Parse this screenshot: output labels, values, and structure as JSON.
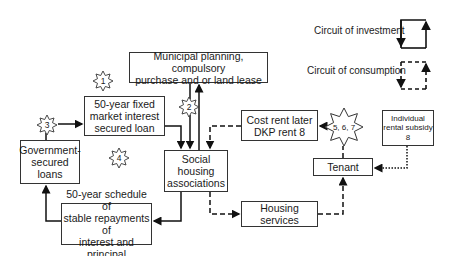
{
  "legend": {
    "investment_label": "Circuit of investment",
    "consumption_label": "Circuit of consumption"
  },
  "boxes": {
    "municipal": "Municipal planning, compulsory\npurchase and or land lease",
    "fixed_loan": "50-year fixed\nmarket interest\nsecured loan",
    "government": "Government-\nsecured\nloans",
    "social_housing": "Social\nhousing\nassociations",
    "schedule": "50-year schedule of\nstable repayments of\ninterest and principal",
    "cost_rent": "Cost rent later\nDKP rent 8",
    "rental_subsidy": "Individual\nrental subsidy\n8",
    "tenant": "Tenant",
    "housing_services": "Housing services"
  },
  "markers": {
    "m1": "1",
    "m2": "2",
    "m3": "3",
    "m4": "4",
    "m567": "5, 6, 7"
  },
  "colors": {
    "line": "#111111",
    "box_border": "#333333"
  }
}
